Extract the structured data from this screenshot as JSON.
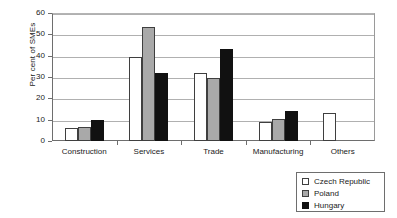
{
  "chart_data": {
    "type": "bar",
    "title": "",
    "xlabel": "",
    "ylabel": "Per cent of SMEs",
    "ylim": [
      0,
      60
    ],
    "ytick_values": [
      0,
      10,
      20,
      30,
      40,
      50,
      60
    ],
    "ytick_labels": [
      "0",
      "10",
      "20",
      "30",
      "40",
      "50",
      "60"
    ],
    "grid": true,
    "legend_position": "bottom-right",
    "categories": [
      "Construction",
      "Services",
      "Trade",
      "Manufacturing",
      "Others"
    ],
    "series": [
      {
        "name": "Czech Republic",
        "color": "#ffffff",
        "values": [
          6,
          39.5,
          32,
          9,
          13
        ]
      },
      {
        "name": "Poland",
        "color": "#a9a9a9",
        "values": [
          6.5,
          53.5,
          29.5,
          10.5,
          0
        ]
      },
      {
        "name": "Hungary",
        "color": "#111111",
        "values": [
          10,
          32,
          43,
          14,
          0
        ]
      }
    ]
  },
  "legend": {
    "items": [
      {
        "label": "Czech Republic",
        "swatch": "czech"
      },
      {
        "label": "Poland",
        "swatch": "poland"
      },
      {
        "label": "Hungary",
        "swatch": "hungary"
      }
    ]
  }
}
